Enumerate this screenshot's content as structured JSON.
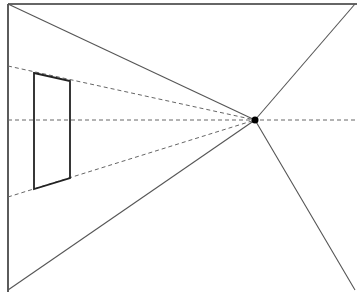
{
  "diagram": {
    "width": 357,
    "height": 292,
    "colors": {
      "background": "#ffffff",
      "frame": "#333333",
      "construction": "#555555",
      "dashed": "#666666",
      "shape": "#222222",
      "point": "#000000"
    },
    "frame": {
      "top": {
        "x1": 8,
        "y1": 4,
        "x2": 357,
        "y2": 4
      },
      "left": {
        "x1": 8,
        "y1": 4,
        "x2": 8,
        "y2": 292
      }
    },
    "vanishing_point": {
      "x": 255,
      "y": 120,
      "r": 3.5
    },
    "solid_rays": [
      {
        "id": "ray-top-left",
        "x1": 8,
        "y1": 4,
        "x2": 255,
        "y2": 120
      },
      {
        "id": "ray-bottom-left",
        "x1": 8,
        "y1": 290,
        "x2": 255,
        "y2": 120
      },
      {
        "id": "ray-top-right",
        "x1": 355,
        "y1": 4,
        "x2": 255,
        "y2": 120
      },
      {
        "id": "ray-bottom-right",
        "x1": 355,
        "y1": 290,
        "x2": 255,
        "y2": 120
      }
    ],
    "dashed_rays": [
      {
        "id": "dashed-top",
        "x1": 8,
        "y1": 66,
        "x2": 255,
        "y2": 120
      },
      {
        "id": "dashed-horizon",
        "x1": 8,
        "y1": 120,
        "x2": 357,
        "y2": 120
      },
      {
        "id": "dashed-bottom",
        "x1": 8,
        "y1": 197,
        "x2": 255,
        "y2": 120
      }
    ],
    "trapezoid": {
      "points": "34,73 70,81 70,178 34,189"
    }
  }
}
